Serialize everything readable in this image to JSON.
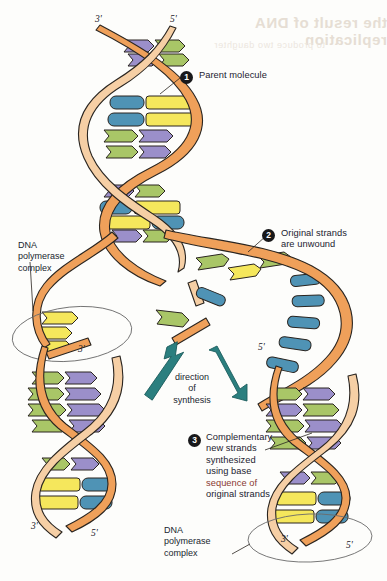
{
  "figure": {
    "type": "dna-replication-diagram",
    "title_visible": false,
    "background_color": "#fdfdfb"
  },
  "palette": {
    "backbone_orange": "#efa05a",
    "backbone_peach": "#f6cfa5",
    "base_purple": "#9b8fca",
    "base_green": "#a9c667",
    "base_blue": "#4f93b5",
    "base_yellow": "#f5e75c",
    "arrow_teal": "#2b7f7f",
    "outline": "#2a2520",
    "text_navy": "#1c2230",
    "text_red": "#8a3a33",
    "badge_black": "#18181a",
    "ellipse_gray": "#6b6b6b"
  },
  "steps": [
    {
      "number": "1",
      "label": "Parent molecule",
      "badge_x": 180,
      "badge_y": 71,
      "text_x": 198,
      "text_y": 67
    },
    {
      "number": "2",
      "label": "Original strands\nare unwound",
      "badge_x": 262,
      "badge_y": 229,
      "text_x": 279,
      "text_y": 226
    },
    {
      "number": "3",
      "label": "Complementary\nnew strands\nsynthesized\nusing base",
      "label_red": "sequence of",
      "label_tail": "original strands",
      "badge_x": 188,
      "badge_y": 434,
      "text_x": 205,
      "text_y": 430
    }
  ],
  "annotations": {
    "polymerase_left": "DNA\npolymerase\ncomplex",
    "polymerase_right": "DNA\npolymerase\ncomplex",
    "direction_of_synthesis": "direction\nof\nsynthesis"
  },
  "end_labels": {
    "parent_top_left": "3'",
    "parent_top_right": "5'",
    "left_fork": "3'",
    "right_fork": "5'",
    "daughter_left_3": "3'",
    "daughter_left_5": "5'",
    "daughter_right_3": "3'",
    "daughter_right_5": "5'"
  },
  "bleed_through": {
    "line1": "the result of DNA replication",
    "line2": "to produce two daughter"
  },
  "legend": {
    "bases": [
      "purple",
      "green",
      "blue",
      "yellow"
    ],
    "strand_types": [
      "original strand (orange backbone)",
      "new strand (peach backbone)"
    ]
  }
}
